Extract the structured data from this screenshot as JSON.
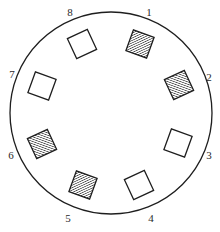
{
  "diagram": {
    "type": "circular-arrangement",
    "circle": {
      "cx": 111,
      "cy": 113,
      "r": 101,
      "stroke": "#1e1e1e"
    },
    "square_size": 22,
    "hatch_color": "#1e1e1e",
    "positions": [
      {
        "label": "1",
        "lx": 149,
        "ly": 16,
        "cx": 140,
        "cy": 44,
        "rot": 20,
        "filled": true
      },
      {
        "label": "2",
        "lx": 209,
        "ly": 81,
        "cx": 179,
        "cy": 85,
        "rot": 65,
        "filled": true
      },
      {
        "label": "3",
        "lx": 209,
        "ly": 159,
        "cx": 178,
        "cy": 143,
        "rot": 20,
        "filled": false
      },
      {
        "label": "4",
        "lx": 151,
        "ly": 222,
        "cx": 139,
        "cy": 185,
        "rot": 65,
        "filled": false
      },
      {
        "label": "5",
        "lx": 68,
        "ly": 222,
        "cx": 83,
        "cy": 185,
        "rot": 20,
        "filled": true
      },
      {
        "label": "6",
        "lx": 11,
        "ly": 159,
        "cx": 42,
        "cy": 144,
        "rot": 65,
        "filled": true
      },
      {
        "label": "7",
        "lx": 12,
        "ly": 78,
        "cx": 42,
        "cy": 86,
        "rot": 20,
        "filled": false
      },
      {
        "label": "8",
        "lx": 70,
        "ly": 16,
        "cx": 82,
        "cy": 44,
        "rot": 65,
        "filled": false
      }
    ]
  }
}
